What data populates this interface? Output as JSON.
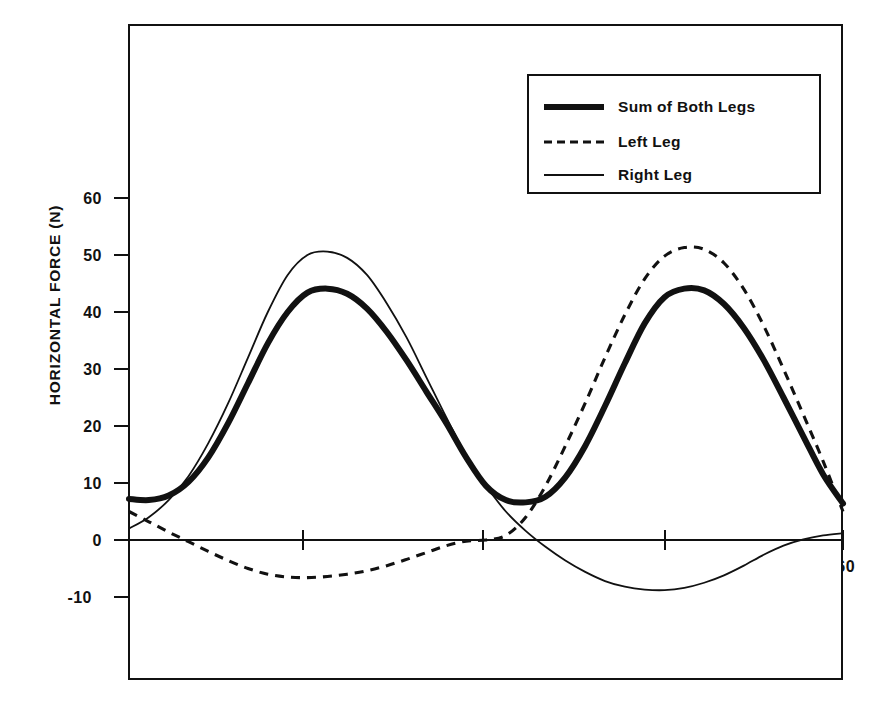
{
  "chart_data": {
    "type": "line",
    "title": "",
    "xlabel": "CRANK ANGLE (deg)",
    "ylabel": "HORIZONTAL FORCE (N)",
    "xlim": [
      0,
      360
    ],
    "ylim": [
      -14,
      72
    ],
    "xticks": [
      90,
      180,
      270,
      360
    ],
    "xtick_labels": [
      "90",
      "180",
      "270",
      "360"
    ],
    "yticks": [
      -10,
      0,
      10,
      20,
      30,
      40,
      50,
      60
    ],
    "ytick_labels": [
      "-10",
      "0",
      "10",
      "20",
      "30",
      "40",
      "50",
      "60"
    ],
    "grid": false,
    "legend_position": "upper right",
    "x": [
      0,
      10,
      20,
      30,
      40,
      50,
      60,
      70,
      80,
      90,
      100,
      110,
      120,
      130,
      140,
      150,
      160,
      170,
      180,
      190,
      200,
      210,
      220,
      230,
      240,
      250,
      260,
      270,
      280,
      290,
      300,
      310,
      320,
      330,
      340,
      350,
      360
    ],
    "series": [
      {
        "name": "Sum of Both Legs",
        "style": "thick-solid",
        "values": [
          7.2,
          7.0,
          7.8,
          10.2,
          14.5,
          20.5,
          27.5,
          34.5,
          40.0,
          43.4,
          44.1,
          43.2,
          40.6,
          36.5,
          31.5,
          26.0,
          20.5,
          14.5,
          9.5,
          7.0,
          6.6,
          7.6,
          11.0,
          16.5,
          23.5,
          31.0,
          38.0,
          42.6,
          44.1,
          43.8,
          41.4,
          37.2,
          31.6,
          25.0,
          18.2,
          11.5,
          6.4
        ]
      },
      {
        "name": "Left Leg",
        "style": "dashed",
        "values": [
          5.0,
          3.2,
          1.4,
          -0.3,
          -2.0,
          -3.6,
          -5.0,
          -6.0,
          -6.5,
          -6.6,
          -6.4,
          -6.0,
          -5.4,
          -4.5,
          -3.4,
          -2.2,
          -1.0,
          -0.2,
          0.0,
          0.8,
          4.0,
          9.5,
          16.5,
          24.0,
          32.0,
          39.5,
          45.8,
          49.8,
          51.3,
          51.0,
          48.6,
          44.0,
          37.6,
          30.0,
          22.0,
          13.8,
          5.0
        ]
      },
      {
        "name": "Right Leg",
        "style": "thin-solid",
        "values": [
          2.0,
          4.0,
          7.0,
          11.2,
          17.0,
          24.0,
          32.0,
          40.0,
          46.5,
          50.0,
          50.6,
          49.5,
          46.5,
          41.5,
          35.5,
          28.5,
          21.5,
          14.8,
          9.5,
          5.0,
          1.6,
          -1.2,
          -3.6,
          -5.6,
          -7.2,
          -8.2,
          -8.7,
          -8.8,
          -8.4,
          -7.5,
          -6.2,
          -4.5,
          -2.6,
          -1.0,
          0.1,
          0.8,
          1.2
        ]
      }
    ]
  },
  "legend": {
    "entries": [
      {
        "label": "Sum of Both Legs",
        "style": "thick-solid"
      },
      {
        "label": "Left Leg",
        "style": "dashed"
      },
      {
        "label": "Right Leg",
        "style": "thin-solid"
      }
    ]
  },
  "axis": {
    "x_title": "CRANK ANGLE (deg)",
    "y_title": "HORIZONTAL FORCE (N)",
    "x_ticks": [
      "90",
      "180",
      "270",
      "360"
    ],
    "y_ticks": [
      "60",
      "50",
      "40",
      "30",
      "20",
      "10",
      "0",
      "-10"
    ]
  },
  "colors": {
    "ink": "#111111",
    "background": "#ffffff"
  }
}
